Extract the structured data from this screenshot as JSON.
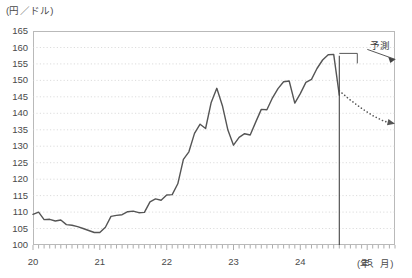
{
  "chart_data": {
    "type": "line",
    "title": "",
    "ylabel": "(円／ドル)",
    "xlabel": "(年、月)",
    "ylim": [
      100,
      165
    ],
    "ytick_step": 5,
    "yticks": [
      165,
      160,
      155,
      150,
      145,
      140,
      135,
      130,
      125,
      120,
      115,
      110,
      105,
      100
    ],
    "xticks": [
      "20",
      "21",
      "22",
      "23",
      "24",
      "25"
    ],
    "xlim_months": [
      "2020-01",
      "2025-06"
    ],
    "grid": true,
    "grid_style": "dotted-horizontal",
    "legend": null,
    "annotations": [
      {
        "name": "forecast-label",
        "text": "予測",
        "x_month": "2024-10",
        "y_value": 160
      },
      {
        "name": "forecast-divider",
        "text": "",
        "x_month": "2024-08",
        "type": "vertical-line"
      }
    ],
    "series": [
      {
        "name": "actual",
        "style": "solid",
        "color": "#555555",
        "x": [
          "2020-01",
          "2020-02",
          "2020-03",
          "2020-04",
          "2020-05",
          "2020-06",
          "2020-07",
          "2020-08",
          "2020-09",
          "2020-10",
          "2020-11",
          "2020-12",
          "2021-01",
          "2021-02",
          "2021-03",
          "2021-04",
          "2021-05",
          "2021-06",
          "2021-07",
          "2021-08",
          "2021-09",
          "2021-10",
          "2021-11",
          "2021-12",
          "2022-01",
          "2022-02",
          "2022-03",
          "2022-04",
          "2022-05",
          "2022-06",
          "2022-07",
          "2022-08",
          "2022-09",
          "2022-10",
          "2022-11",
          "2022-12",
          "2023-01",
          "2023-02",
          "2023-03",
          "2023-04",
          "2023-05",
          "2023-06",
          "2023-07",
          "2023-08",
          "2023-09",
          "2023-10",
          "2023-11",
          "2023-12",
          "2024-01",
          "2024-02",
          "2024-03",
          "2024-04",
          "2024-05",
          "2024-06",
          "2024-07",
          "2024-08"
        ],
        "values": [
          109.3,
          110.0,
          107.7,
          107.8,
          107.3,
          107.6,
          106.2,
          106.0,
          105.6,
          105.0,
          104.4,
          103.8,
          103.8,
          105.4,
          108.7,
          109.0,
          109.2,
          110.1,
          110.3,
          109.8,
          109.9,
          113.1,
          114.0,
          113.6,
          115.2,
          115.3,
          118.6,
          126.0,
          128.3,
          133.9,
          136.7,
          135.4,
          143.3,
          147.6,
          142.3,
          134.9,
          130.3,
          132.7,
          133.8,
          133.4,
          137.4,
          141.2,
          141.1,
          144.7,
          147.5,
          149.6,
          149.8,
          143.1,
          146.0,
          149.4,
          150.3,
          153.6,
          156.2,
          157.8,
          157.9,
          145.5
        ]
      },
      {
        "name": "forecast",
        "style": "dotted",
        "color": "#555555",
        "x": [
          "2024-08",
          "2024-10",
          "2024-12",
          "2025-02",
          "2025-04",
          "2025-06"
        ],
        "values": [
          146.8,
          144.0,
          141.5,
          139.3,
          137.6,
          136.8
        ]
      }
    ]
  },
  "labels": {
    "y_unit": "(円／ドル)",
    "x_unit": "(年、月)",
    "forecast": "予測"
  }
}
